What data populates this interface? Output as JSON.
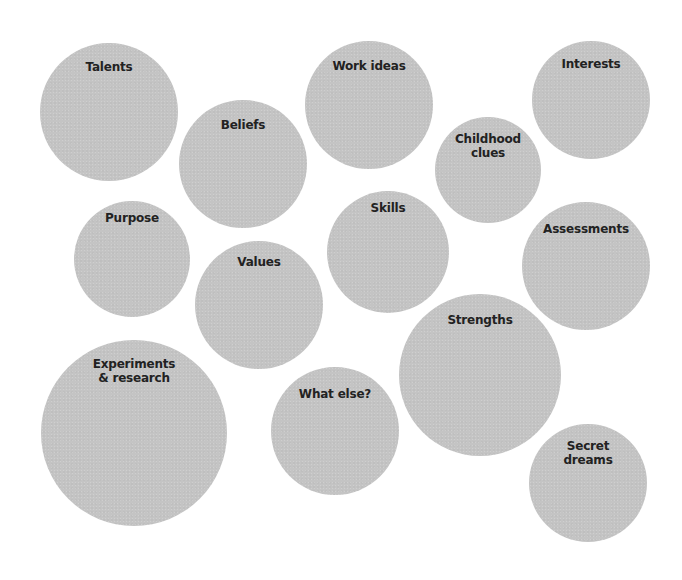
{
  "diagram": {
    "type": "bubble-cluster",
    "bubble_color": "#c4c4c4",
    "label_color": "#222222",
    "background": "#ffffff",
    "bubbles": [
      {
        "id": "talents",
        "label": "Talents",
        "cx": 109,
        "cy": 112,
        "r": 69,
        "label_top": 17
      },
      {
        "id": "beliefs",
        "label": "Beliefs",
        "cx": 243,
        "cy": 164,
        "r": 64,
        "label_top": 18
      },
      {
        "id": "work-ideas",
        "label": "Work ideas",
        "cx": 369,
        "cy": 105,
        "r": 64,
        "label_top": 18
      },
      {
        "id": "interests",
        "label": "Interests",
        "cx": 591,
        "cy": 100,
        "r": 59,
        "label_top": 16
      },
      {
        "id": "childhood-clues",
        "label": "Childhood\nclues",
        "cx": 488,
        "cy": 170,
        "r": 53,
        "label_top": 15
      },
      {
        "id": "purpose",
        "label": "Purpose",
        "cx": 132,
        "cy": 259,
        "r": 58,
        "label_top": 10
      },
      {
        "id": "skills",
        "label": "Skills",
        "cx": 388,
        "cy": 252,
        "r": 61,
        "label_top": 10
      },
      {
        "id": "values",
        "label": "Values",
        "cx": 259,
        "cy": 305,
        "r": 64,
        "label_top": 14
      },
      {
        "id": "assessments",
        "label": "Assessments",
        "cx": 586,
        "cy": 266,
        "r": 64,
        "label_top": 20
      },
      {
        "id": "strengths",
        "label": "Strengths",
        "cx": 480,
        "cy": 375,
        "r": 81,
        "label_top": 19
      },
      {
        "id": "experiments",
        "label": "Experiments\n& research",
        "cx": 134,
        "cy": 433,
        "r": 93,
        "label_top": 17
      },
      {
        "id": "what-else",
        "label": "What else?",
        "cx": 335,
        "cy": 431,
        "r": 64,
        "label_top": 20
      },
      {
        "id": "secret-dreams",
        "label": "Secret\ndreams",
        "cx": 588,
        "cy": 483,
        "r": 59,
        "label_top": 15
      }
    ]
  }
}
